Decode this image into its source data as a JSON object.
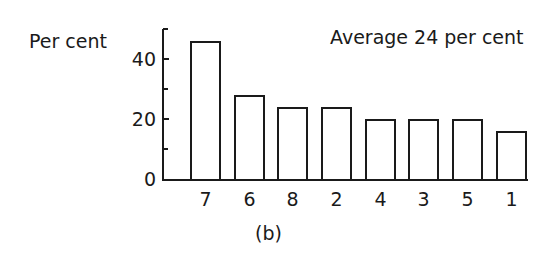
{
  "chart_data": {
    "type": "bar",
    "title": "",
    "ylabel": "Per cent",
    "xlabel": "",
    "annotation": "Average 24 per cent",
    "panel_label": "(b)",
    "categories": [
      "7",
      "6",
      "8",
      "2",
      "4",
      "3",
      "5",
      "1"
    ],
    "values": [
      46,
      28,
      24,
      24,
      20,
      20,
      20,
      16
    ],
    "ylim": [
      0,
      50
    ],
    "yticks": [
      0,
      20,
      40
    ],
    "minor_yticks": [
      10,
      30,
      50
    ],
    "grid": false,
    "legend": null
  },
  "labels": {
    "ylabel": "Per cent",
    "annotation": "Average 24 per cent",
    "panel": "(b)",
    "ytick_0": "0",
    "ytick_20": "20",
    "ytick_40": "40",
    "x": [
      "7",
      "6",
      "8",
      "2",
      "4",
      "3",
      "5",
      "1"
    ]
  }
}
